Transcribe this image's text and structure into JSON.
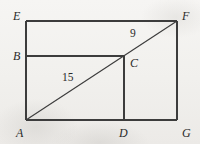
{
  "figure": {
    "background_color": "#f2f1ef",
    "line_color": "#3a3a3a",
    "label_color": "#2a2a2a",
    "vertices": [
      {
        "id": "E",
        "label": "E",
        "x": 26,
        "y": 21,
        "label_x": 13,
        "label_y": 10
      },
      {
        "id": "F",
        "label": "F",
        "x": 177,
        "y": 21,
        "label_x": 182,
        "label_y": 10
      },
      {
        "id": "B",
        "label": "B",
        "x": 26,
        "y": 56,
        "label_x": 13,
        "label_y": 50
      },
      {
        "id": "C",
        "label": "C",
        "x": 124,
        "y": 56,
        "label_x": 130,
        "label_y": 57
      },
      {
        "id": "A",
        "label": "A",
        "x": 26,
        "y": 120,
        "label_x": 16,
        "label_y": 127
      },
      {
        "id": "D",
        "label": "D",
        "x": 124,
        "y": 120,
        "label_x": 119,
        "label_y": 127
      },
      {
        "id": "G",
        "label": "G",
        "x": 177,
        "y": 120,
        "label_x": 182,
        "label_y": 127
      }
    ],
    "segments": [
      {
        "name": "top-edge-EF",
        "from": "E",
        "to": "F"
      },
      {
        "name": "left-edge-EA",
        "from": "E",
        "to": "A"
      },
      {
        "name": "right-edge-FG",
        "from": "F",
        "to": "G"
      },
      {
        "name": "bottom-edge-AG",
        "from": "A",
        "to": "G"
      },
      {
        "name": "horizontal-BC",
        "from": "B",
        "to": "C"
      },
      {
        "name": "vertical-DC",
        "from": "D",
        "to": "C"
      },
      {
        "name": "diagonal-AF",
        "from": "A",
        "to": "F"
      }
    ],
    "measures": [
      {
        "name": "segment-AC-length",
        "value": "15",
        "label_x": 62,
        "label_y": 72
      },
      {
        "name": "segment-CF-length",
        "value": "9",
        "label_x": 130,
        "label_y": 28
      }
    ]
  }
}
